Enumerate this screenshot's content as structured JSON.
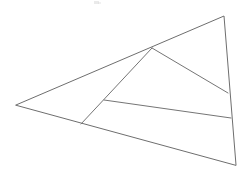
{
  "figure": {
    "canvas": {
      "width": 245,
      "height": 190,
      "background": "#ffffff"
    },
    "stroke_color": "#6e6e6e",
    "stroke_width": 1,
    "points": {
      "left_vertex": {
        "label": "A",
        "x": 16,
        "y": 105
      },
      "top_right_vertex": {
        "label": "B",
        "x": 224,
        "y": 16
      },
      "bottom_right_vertex": {
        "label": "C",
        "x": 236,
        "y": 165
      },
      "upper_junction": {
        "label": "D",
        "x": 152,
        "y": 48
      },
      "bottom_edge_point": {
        "label": "E",
        "x": 81,
        "y": 124
      },
      "interior_junction": {
        "label": "F",
        "x": 104,
        "y": 100
      },
      "right_edge_upper": {
        "label": "G",
        "x": 228,
        "y": 93
      },
      "right_edge_lower": {
        "label": "H",
        "x": 231,
        "y": 118
      }
    },
    "outline": {
      "name": "main-triangle",
      "path": "M 16 105 L 224 16 L 236 165 Z"
    },
    "segments": [
      {
        "name": "cevian-upper-junction-to-bottom-edge",
        "from": "D",
        "to": "E",
        "path": "M 152 48 L 81 124"
      },
      {
        "name": "cevian-upper-junction-to-right-edge",
        "from": "D",
        "to": "G",
        "path": "M 152 48 L 228 93"
      },
      {
        "name": "cevian-interior-to-right-edge",
        "from": "F",
        "to": "H",
        "path": "M 104 100 L 231 118"
      }
    ],
    "artifacts": [
      {
        "name": "scan-speck-a",
        "x": 94,
        "y": 1,
        "width": 5,
        "height": 3
      },
      {
        "name": "scan-speck-b",
        "x": 98,
        "y": 2,
        "width": 3,
        "height": 2
      }
    ]
  }
}
